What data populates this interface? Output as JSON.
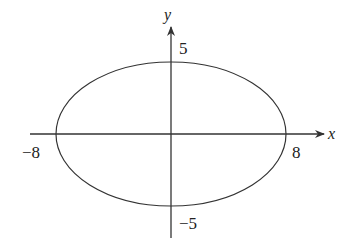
{
  "diagram": {
    "type": "ellipse-graph",
    "equation": "x^2/64 + y^2/25 = 1",
    "axes": {
      "x_label": "x",
      "y_label": "y"
    },
    "semi_axis_x": 8,
    "semi_axis_y": 5,
    "tick_labels": {
      "x_neg": "−8",
      "x_pos": "8",
      "y_pos": "5",
      "y_neg": "−5"
    },
    "colors": {
      "stroke": "#333333",
      "background": "#ffffff"
    }
  }
}
